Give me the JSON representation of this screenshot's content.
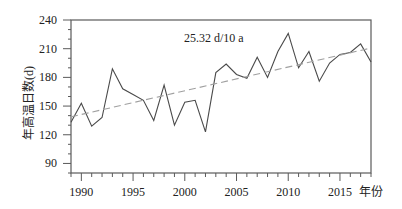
{
  "chart_data": {
    "type": "line",
    "title": "",
    "xlabel": "年份",
    "ylabel": "年高温日数(d)",
    "x": [
      1989,
      1990,
      1991,
      1992,
      1993,
      1994,
      1995,
      1996,
      1997,
      1998,
      1999,
      2000,
      2001,
      2002,
      2003,
      2004,
      2005,
      2006,
      2007,
      2008,
      2009,
      2010,
      2011,
      2012,
      2013,
      2014,
      2015,
      2016,
      2017,
      2018
    ],
    "series": [
      {
        "name": "年高温日数",
        "style": "solid",
        "values": [
          133,
          153,
          129,
          138,
          189,
          168,
          162,
          156,
          135,
          172,
          130,
          154,
          156,
          123,
          185,
          194,
          183,
          179,
          201,
          180,
          207,
          226,
          190,
          207,
          176,
          195,
          204,
          206,
          215,
          196
        ]
      },
      {
        "name": "线性趋势",
        "style": "dashed",
        "x": [
          1989,
          2018
        ],
        "values": [
          138.7,
          210.7
        ]
      }
    ],
    "annotations": [
      {
        "text": "25.32 d/10 a",
        "position": "top-center"
      }
    ],
    "xlim": [
      1989,
      2018
    ],
    "ylim": [
      80,
      240
    ],
    "xticks_major": [
      1990,
      1995,
      2000,
      2005,
      2010,
      2015
    ],
    "xticks_minor_step": 1,
    "yticks_major": [
      90,
      120,
      150,
      180,
      210,
      240
    ],
    "yticks_minor_step": 10,
    "grid": false,
    "legend": null
  },
  "colors": {
    "axis": "#5a5a5a",
    "data_line": "#4a4a4a",
    "trend_line": "#a0a0a0",
    "text": "#222222",
    "background": "#ffffff"
  }
}
